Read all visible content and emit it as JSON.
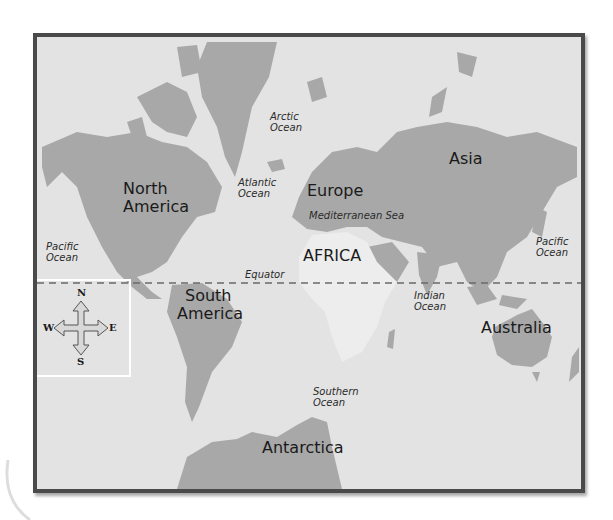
{
  "map": {
    "title": "World Map",
    "colors": {
      "ocean": "#e3e3e3",
      "land": "#a8a8a8",
      "africa": "#ececec",
      "frame": "#4a4a4a",
      "equator": "#6a6a6a"
    },
    "continents": [
      {
        "id": "north-america",
        "label_line1": "North",
        "label_line2": "America"
      },
      {
        "id": "south-america",
        "label_line1": "South",
        "label_line2": "America"
      },
      {
        "id": "europe",
        "label": "Europe"
      },
      {
        "id": "asia",
        "label": "Asia"
      },
      {
        "id": "africa",
        "label": "AFRICA"
      },
      {
        "id": "australia",
        "label": "Australia"
      },
      {
        "id": "antarctica",
        "label": "Antarctica"
      }
    ],
    "water_bodies": [
      {
        "id": "arctic-ocean",
        "line1": "Arctic",
        "line2": "Ocean"
      },
      {
        "id": "atlantic-ocean",
        "line1": "Atlantic",
        "line2": "Ocean"
      },
      {
        "id": "pacific-ocean-west",
        "line1": "Pacific",
        "line2": "Ocean"
      },
      {
        "id": "pacific-ocean-east",
        "line1": "Pacific",
        "line2": "Ocean"
      },
      {
        "id": "indian-ocean",
        "line1": "Indian",
        "line2": "Ocean"
      },
      {
        "id": "southern-ocean",
        "line1": "Southern",
        "line2": "Ocean"
      },
      {
        "id": "mediterranean-sea",
        "label": "Mediterranean Sea"
      }
    ],
    "equator_label": "Equator",
    "compass": {
      "north": "N",
      "south": "S",
      "east": "E",
      "west": "W"
    }
  }
}
